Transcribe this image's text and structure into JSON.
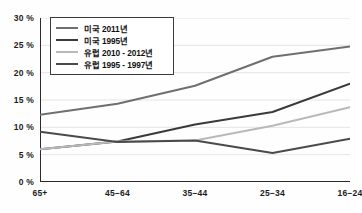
{
  "chart_data": {
    "type": "line",
    "title": "",
    "xlabel": "",
    "ylabel": "",
    "categories": [
      "65+",
      "45−64",
      "35−44",
      "25−34",
      "16−24"
    ],
    "ylim": [
      0,
      30
    ],
    "yticks": [
      "0 %",
      "5 %",
      "10 %",
      "15 %",
      "20 %",
      "25 %",
      "30 %"
    ],
    "ytick_values": [
      0,
      5,
      10,
      15,
      20,
      25,
      30
    ],
    "grid": true,
    "legend_position": "top-left",
    "series": [
      {
        "name": "미국 2011년",
        "color": "#6f6f6f",
        "width": 2.0,
        "values": [
          12.3,
          14.3,
          17.6,
          22.9,
          24.8
        ]
      },
      {
        "name": "미국 1995년",
        "color": "#3a3a3a",
        "width": 2.0,
        "values": [
          6.0,
          7.4,
          10.5,
          12.8,
          18.0
        ]
      },
      {
        "name": "유럽 2010 - 2012년",
        "color": "#b9b9b9",
        "width": 2.0,
        "values": [
          6.0,
          7.4,
          7.6,
          10.3,
          13.7
        ]
      },
      {
        "name": "유럽 1995 - 1997년",
        "color": "#4a4a4a",
        "width": 2.0,
        "values": [
          9.2,
          7.3,
          7.6,
          5.3,
          7.9
        ]
      }
    ]
  }
}
